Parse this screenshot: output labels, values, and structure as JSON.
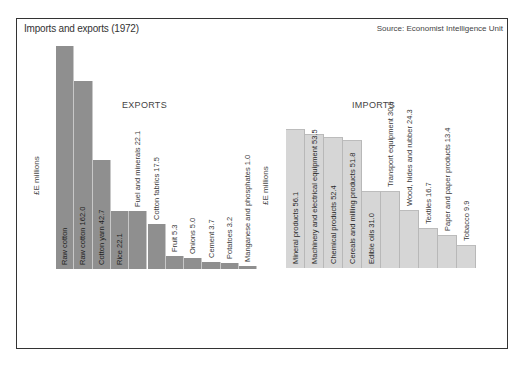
{
  "header": {
    "title": "Imports and exports  (1972)",
    "source": "Source: Economist Intelligence Unit"
  },
  "exports": {
    "heading": "EXPORTS",
    "unit_label": "£E millions"
  },
  "imports": {
    "heading": "IMPORTS",
    "unit_label": "£E millions"
  },
  "colors": {
    "exports_bar": "#8f8f8f",
    "imports_bar": "#d6d6d6",
    "frame": "#333333"
  },
  "chart_data": [
    {
      "type": "bar",
      "title": "EXPORTS",
      "ylabel": "£E millions",
      "categories": [
        "Raw cotton",
        "Raw cotton",
        "Cotton yarn",
        "Rice",
        "Fuel and minerals",
        "Cotton fabrics",
        "Fruit",
        "Onions",
        "Cement",
        "Potatoes",
        "Manganese and phosphates"
      ],
      "labels": [
        "Raw cotton",
        "Raw cotton 162.0",
        "Cotton yarn 42.7",
        "Rice 22.1",
        "Fuel and minerals 22.1",
        "Cotton fabrics 17.5",
        "Fruit 5.3",
        "Onions 5.0",
        "Cement 3.7",
        "Potatoes 3.2",
        "Manganese and phosphates 1.0"
      ],
      "values": [
        null,
        162.0,
        42.7,
        22.1,
        22.1,
        17.5,
        5.3,
        5.0,
        3.7,
        3.2,
        1.0
      ],
      "bar_top_px": [
        46,
        81,
        160,
        211,
        211,
        224,
        256,
        258,
        262,
        263,
        266
      ]
    },
    {
      "type": "bar",
      "title": "IMPORTS",
      "ylabel": "£E millions",
      "categories": [
        "Mineral products",
        "Machinery and electrical equipment",
        "Chemical products",
        "Cereals and milling products",
        "Edible oils",
        "Transport equipment",
        "Wood, hides and rubber",
        "Textiles",
        "Paper and paper products",
        "Tobacco"
      ],
      "labels": [
        "Mineral products 56.1",
        "Machinery and electrical equipment 53.5",
        "Chemical products 52.4",
        "Cereals and milling products 51.8",
        "Edible oils 31.0",
        "Transport equipment 30.9",
        "Wood, hides and rubber 24.3",
        "Textiles 16.7",
        "Paper and paper products 13.4",
        "Tobacco 9.9"
      ],
      "values": [
        56.1,
        53.5,
        52.4,
        51.8,
        31.0,
        30.9,
        24.3,
        16.7,
        13.4,
        9.9
      ],
      "bar_top_px": [
        129,
        134,
        137,
        140,
        191,
        191,
        210,
        228,
        235,
        245
      ]
    }
  ]
}
